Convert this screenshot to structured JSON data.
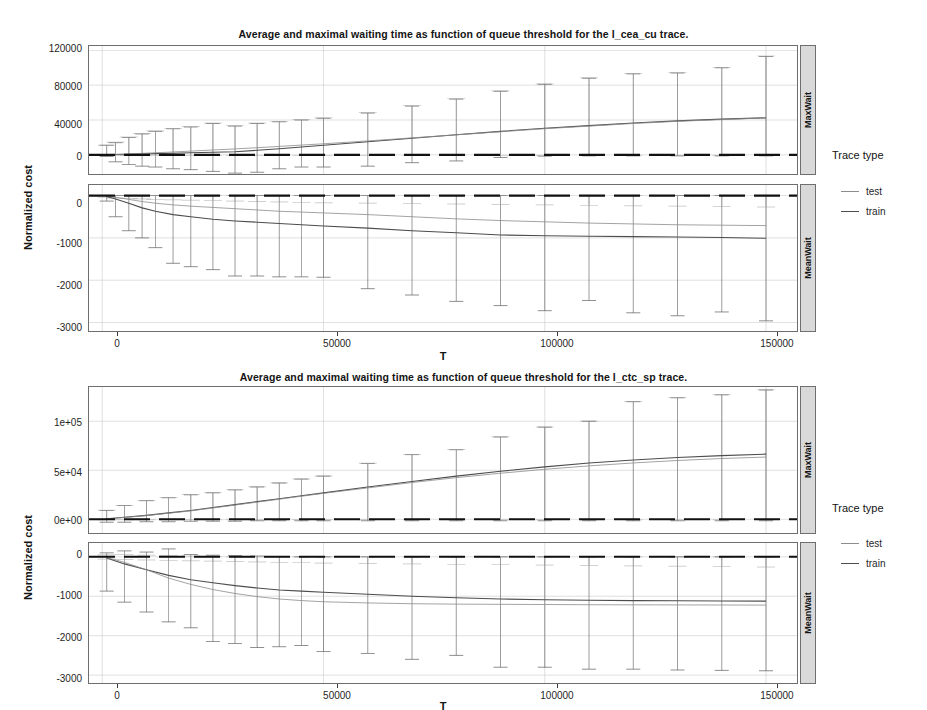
{
  "figures": [
    {
      "id": "fig-cea-cu",
      "title": "Average and maximal waiting time as function of queue threshold for the l_cea_cu trace.",
      "ylabel": "Normalized cost",
      "xlabel": "T",
      "xticks": [
        "0",
        "50000",
        "100000",
        "150000"
      ],
      "legend_title": "Trace type",
      "legend": [
        {
          "label": "test",
          "color": "#8c8c8c"
        },
        {
          "label": "train",
          "color": "#4d4d4d"
        }
      ],
      "facets": [
        {
          "label": "MaxWait",
          "yticks": [
            "120000",
            "80000",
            "40000",
            "0"
          ]
        },
        {
          "label": "MeanWait",
          "yticks": [
            "0",
            "-1000",
            "-2000",
            "-3000"
          ]
        }
      ]
    },
    {
      "id": "fig-ctc-sp",
      "title": "Average and maximal waiting time as function of queue threshold for the l_ctc_sp trace.",
      "ylabel": "Normalized cost",
      "xlabel": "T",
      "xticks": [
        "0",
        "50000",
        "100000",
        "150000"
      ],
      "legend_title": "Trace type",
      "legend": [
        {
          "label": "test",
          "color": "#8c8c8c"
        },
        {
          "label": "train",
          "color": "#4d4d4d"
        }
      ],
      "facets": [
        {
          "label": "MaxWait",
          "yticks": [
            "1e+05",
            "5e+04",
            "0e+00"
          ]
        },
        {
          "label": "MeanWait",
          "yticks": [
            "0",
            "-1000",
            "-2000",
            "-3000"
          ]
        }
      ]
    }
  ],
  "chart_data": [
    {
      "type": "line",
      "title": "Average and maximal waiting time as function of queue threshold for the l_cea_cu trace.",
      "xlabel": "T",
      "ylabel": "Normalized cost",
      "facet": "MaxWait",
      "facet_variable": "Trace type",
      "grid": true,
      "legend_position": "right",
      "xlim": [
        -3000,
        157000
      ],
      "ylim": [
        -22000,
        125000
      ],
      "xticks": [
        0,
        50000,
        100000,
        150000
      ],
      "yticks": [
        0,
        40000,
        80000,
        120000
      ],
      "x": [
        1000,
        3000,
        6000,
        9000,
        12000,
        16000,
        20000,
        25000,
        30000,
        35000,
        40000,
        45000,
        50000,
        60000,
        70000,
        80000,
        90000,
        100000,
        110000,
        120000,
        130000,
        140000,
        150000
      ],
      "series": [
        {
          "name": "train",
          "color": "#4d4d4d",
          "values": [
            200,
            400,
            700,
            1000,
            1400,
            1800,
            2400,
            3000,
            3600,
            5200,
            7000,
            9000,
            11000,
            15000,
            19000,
            23000,
            27000,
            30500,
            33500,
            36500,
            39000,
            41000,
            42500
          ],
          "errorbar_high": [
            11000,
            14000,
            20000,
            24000,
            27000,
            30000,
            32000,
            36000,
            33000,
            36000,
            38000,
            40000,
            42000,
            48000,
            56000,
            64000,
            73000,
            81000,
            88000,
            93000,
            94000,
            100000,
            113000
          ],
          "errorbar_low": [
            -2000,
            -8000,
            -11000,
            -13000,
            -14000,
            -16000,
            -17000,
            -19000,
            -21000,
            -20000,
            -16000,
            -14000,
            -14000,
            -13000,
            -9000,
            -7000,
            -3000,
            -1500,
            -1200,
            -1200,
            -1200,
            -1200,
            -1200
          ]
        },
        {
          "name": "test",
          "color": "#8c8c8c",
          "values": [
            300,
            600,
            1100,
            1700,
            2400,
            3300,
            4300,
            5600,
            6800,
            8200,
            9700,
            11200,
            12700,
            16000,
            19500,
            23000,
            26500,
            30000,
            33000,
            36000,
            38500,
            40500,
            42500
          ],
          "errorbar_high": [
            11000,
            14500,
            20500,
            24500,
            27500,
            30500,
            32500,
            36500,
            33500,
            36500,
            38500,
            40500,
            42500,
            48500,
            56500,
            64500,
            73500,
            81500,
            88500,
            93500,
            94500,
            100500,
            113500
          ],
          "errorbar_low": [
            -1000,
            -1000,
            -1000,
            -1000,
            -1000,
            -1000,
            -1000,
            -1000,
            -1000,
            -1000,
            -1000,
            -1000,
            -1000,
            -1000,
            -1000,
            -1000,
            -1000,
            -1000,
            -1000,
            -1000,
            -1000,
            -1000,
            -1000
          ]
        }
      ]
    },
    {
      "type": "line",
      "title": "Average and maximal waiting time as function of queue threshold for the l_cea_cu trace.",
      "xlabel": "T",
      "ylabel": "Normalized cost",
      "facet": "MeanWait",
      "facet_variable": "Trace type",
      "grid": true,
      "legend_position": "right",
      "xlim": [
        -3000,
        157000
      ],
      "ylim": [
        -3200,
        250
      ],
      "xticks": [
        0,
        50000,
        100000,
        150000
      ],
      "yticks": [
        0,
        -1000,
        -2000,
        -3000
      ],
      "x": [
        1000,
        3000,
        6000,
        9000,
        12000,
        16000,
        20000,
        25000,
        30000,
        35000,
        40000,
        45000,
        50000,
        60000,
        70000,
        80000,
        90000,
        100000,
        110000,
        120000,
        130000,
        140000,
        150000
      ],
      "series": [
        {
          "name": "train",
          "color": "#4d4d4d",
          "values": [
            -20,
            -80,
            -180,
            -290,
            -370,
            -450,
            -500,
            -560,
            -600,
            -630,
            -660,
            -690,
            -720,
            -770,
            -830,
            -880,
            -930,
            -950,
            -960,
            -970,
            -980,
            -990,
            -1010
          ],
          "errorbar_high": [
            0,
            0,
            0,
            0,
            0,
            0,
            0,
            0,
            0,
            0,
            0,
            0,
            0,
            0,
            0,
            0,
            0,
            0,
            0,
            0,
            0,
            0,
            0
          ],
          "errorbar_low": [
            -130,
            -500,
            -830,
            -1000,
            -1230,
            -1600,
            -1680,
            -1750,
            -1900,
            -1900,
            -1920,
            -1920,
            -1930,
            -2200,
            -2350,
            -2500,
            -2600,
            -2720,
            -2480,
            -2770,
            -2840,
            -2750,
            -2960
          ]
        },
        {
          "name": "test",
          "color": "#8c8c8c",
          "values": [
            -10,
            -40,
            -90,
            -140,
            -180,
            -220,
            -250,
            -280,
            -310,
            -340,
            -370,
            -390,
            -410,
            -450,
            -500,
            -550,
            -590,
            -620,
            -650,
            -670,
            -690,
            -700,
            -710
          ],
          "errorbar_high": [
            0,
            0,
            0,
            0,
            0,
            0,
            0,
            0,
            0,
            0,
            0,
            0,
            0,
            0,
            0,
            0,
            0,
            0,
            0,
            0,
            0,
            0,
            0
          ],
          "errorbar_low": [
            -50,
            -60,
            -70,
            -80,
            -90,
            -100,
            -110,
            -120,
            -130,
            -140,
            -150,
            -160,
            -170,
            -180,
            -190,
            -200,
            -210,
            -220,
            -230,
            -240,
            -250,
            -260,
            -270
          ]
        }
      ]
    },
    {
      "type": "line",
      "title": "Average and maximal waiting time as function of queue threshold for the l_ctc_sp trace.",
      "xlabel": "T",
      "ylabel": "Normalized cost",
      "facet": "MaxWait",
      "facet_variable": "Trace type",
      "grid": true,
      "legend_position": "right",
      "xlim": [
        -3000,
        157000
      ],
      "ylim": [
        -14000,
        135000
      ],
      "xticks": [
        0,
        50000,
        100000,
        150000
      ],
      "yticks": [
        0,
        50000,
        100000
      ],
      "ytick_labels": [
        "0e+00",
        "5e+04",
        "1e+05"
      ],
      "x": [
        1000,
        5000,
        10000,
        15000,
        20000,
        25000,
        30000,
        35000,
        40000,
        45000,
        50000,
        60000,
        70000,
        80000,
        90000,
        100000,
        110000,
        120000,
        130000,
        140000,
        150000
      ],
      "series": [
        {
          "name": "train",
          "color": "#4d4d4d",
          "values": [
            500,
            2000,
            4000,
            6500,
            9000,
            12000,
            15000,
            18000,
            21000,
            24000,
            27000,
            33000,
            38500,
            44000,
            49000,
            53500,
            57500,
            60500,
            63000,
            65000,
            66500
          ],
          "errorbar_high": [
            9000,
            14000,
            19000,
            22000,
            25000,
            27000,
            30000,
            33000,
            37000,
            41000,
            44000,
            57000,
            66000,
            71000,
            84000,
            94000,
            100000,
            120000,
            124000,
            127000,
            132000
          ],
          "errorbar_low": [
            -3000,
            -3000,
            -2500,
            -2500,
            -2000,
            -2000,
            -2000,
            -1500,
            -1500,
            -1500,
            -1500,
            -1500,
            -1500,
            -1500,
            -1500,
            -1500,
            -1500,
            -1500,
            -1500,
            -1500,
            -1500
          ]
        },
        {
          "name": "test",
          "color": "#8c8c8c",
          "values": [
            400,
            1800,
            3800,
            6200,
            8600,
            11500,
            14500,
            17500,
            20500,
            23500,
            26500,
            32000,
            37500,
            42500,
            47000,
            51000,
            54500,
            57500,
            60000,
            62000,
            63500
          ],
          "errorbar_high": [
            9200,
            14200,
            19200,
            22200,
            25200,
            27200,
            30200,
            33200,
            37200,
            41200,
            44200,
            57200,
            66200,
            71200,
            84200,
            94200,
            100200,
            120200,
            124200,
            127200,
            132200
          ],
          "errorbar_low": [
            -500,
            -500,
            -500,
            -500,
            -500,
            -500,
            -500,
            -500,
            -500,
            -500,
            -500,
            -500,
            -500,
            -500,
            -500,
            -500,
            -500,
            -500,
            -500,
            -500,
            -500
          ]
        }
      ]
    },
    {
      "type": "line",
      "title": "Average and maximal waiting time as function of queue threshold for the l_ctc_sp trace.",
      "xlabel": "T",
      "ylabel": "Normalized cost",
      "facet": "MeanWait",
      "facet_variable": "Trace type",
      "grid": true,
      "legend_position": "right",
      "xlim": [
        -3000,
        157000
      ],
      "ylim": [
        -3200,
        350
      ],
      "xticks": [
        0,
        50000,
        100000,
        150000
      ],
      "yticks": [
        0,
        -1000,
        -2000,
        -3000
      ],
      "x": [
        1000,
        5000,
        10000,
        15000,
        20000,
        25000,
        30000,
        35000,
        40000,
        45000,
        50000,
        60000,
        70000,
        80000,
        90000,
        100000,
        110000,
        120000,
        130000,
        140000,
        150000
      ],
      "series": [
        {
          "name": "train",
          "color": "#4d4d4d",
          "values": [
            -30,
            -180,
            -330,
            -470,
            -580,
            -660,
            -730,
            -790,
            -840,
            -870,
            -900,
            -950,
            -1000,
            -1040,
            -1070,
            -1090,
            -1100,
            -1110,
            -1115,
            -1120,
            -1125
          ],
          "errorbar_high": [
            100,
            150,
            120,
            200,
            60,
            40,
            30,
            20,
            10,
            0,
            0,
            0,
            0,
            0,
            0,
            0,
            0,
            0,
            0,
            0,
            0
          ],
          "errorbar_low": [
            -870,
            -1150,
            -1400,
            -1650,
            -1800,
            -2150,
            -2200,
            -2300,
            -2280,
            -2250,
            -2400,
            -2450,
            -2600,
            -2500,
            -2800,
            -2800,
            -2850,
            -2850,
            -2870,
            -2880,
            -2890
          ]
        },
        {
          "name": "test",
          "color": "#8c8c8c",
          "values": [
            -20,
            -140,
            -330,
            -540,
            -700,
            -830,
            -930,
            -1010,
            -1070,
            -1110,
            -1140,
            -1170,
            -1190,
            -1200,
            -1205,
            -1210,
            -1215,
            -1218,
            -1220,
            -1222,
            -1225
          ],
          "errorbar_high": [
            50,
            60,
            40,
            30,
            20,
            10,
            0,
            0,
            0,
            0,
            0,
            0,
            0,
            0,
            0,
            0,
            0,
            0,
            0,
            0,
            0
          ],
          "errorbar_low": [
            -60,
            -70,
            -80,
            -90,
            -100,
            -110,
            -120,
            -130,
            -140,
            -150,
            -160,
            -170,
            -180,
            -190,
            -200,
            -210,
            -220,
            -230,
            -240,
            -250,
            -260
          ]
        }
      ]
    }
  ]
}
